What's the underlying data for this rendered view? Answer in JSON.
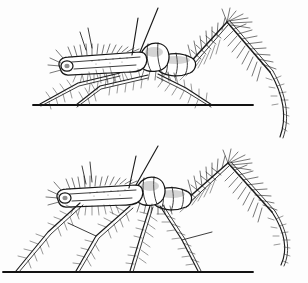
{
  "figure": {
    "background_color": "#fdfdfd",
    "ink_color": "#1b1b1b",
    "width": 308,
    "height": 283,
    "caption": "",
    "panels": [
      {
        "id": "upper",
        "name": "upper-posture",
        "label": "",
        "posture": "raised stance, body held high and horizontal, hind leg folded into tall inverted-V with curved tarsus trailing right",
        "ground_line": {
          "x1": 33,
          "y1": 105,
          "x2": 253,
          "y2": 105
        },
        "body": {
          "head_x": 63,
          "head_y": 64,
          "thorax_x": 150,
          "thorax_y": 50,
          "abdomen_x": 185,
          "abdomen_y": 62,
          "body_angle_deg": -4
        },
        "antennae": [
          {
            "from_x": 140,
            "from_y": 52,
            "to_x": 158,
            "to_y": 8
          },
          {
            "from_x": 132,
            "from_y": 55,
            "to_x": 138,
            "to_y": 18
          },
          {
            "from_x": 92,
            "from_y": 48,
            "to_x": 88,
            "to_y": 28
          }
        ],
        "legs": [
          {
            "name": "foreleg",
            "coxa_x": 120,
            "coxa_y": 72,
            "knee_x": 78,
            "knee_y": 82,
            "foot_x": 40,
            "foot_y": 104
          },
          {
            "name": "midleg",
            "coxa_x": 148,
            "coxa_y": 74,
            "knee_x": 100,
            "knee_y": 86,
            "foot_x": 75,
            "foot_y": 105
          },
          {
            "name": "hindleg-near",
            "coxa_x": 160,
            "coxa_y": 74,
            "knee_x": 185,
            "knee_y": 88,
            "foot_x": 212,
            "foot_y": 105
          },
          {
            "name": "hindleg-long",
            "coxa_x": 186,
            "coxa_y": 66,
            "knee_x": 227,
            "knee_y": 22,
            "tarsus_tip_x": 283,
            "tarsus_tip_y": 137
          }
        ]
      },
      {
        "id": "lower",
        "name": "lower-posture",
        "label": "",
        "posture": "crouched stance, body lowered, four legs splayed to ground, hind leg folded into inverted-V with long curved tarsus",
        "ground_line": {
          "x1": 3,
          "y1": 272,
          "x2": 253,
          "y2": 272
        },
        "body": {
          "head_x": 62,
          "head_y": 196,
          "thorax_x": 150,
          "thorax_y": 186,
          "abdomen_x": 180,
          "abdomen_y": 196,
          "body_angle_deg": -3
        },
        "antennae": [
          {
            "from_x": 140,
            "from_y": 188,
            "to_x": 158,
            "to_y": 146
          },
          {
            "from_x": 131,
            "from_y": 190,
            "to_x": 136,
            "to_y": 156
          },
          {
            "from_x": 92,
            "from_y": 182,
            "to_x": 90,
            "to_y": 162
          }
        ],
        "legs": [
          {
            "name": "foreleg",
            "coxa_x": 80,
            "coxa_y": 200,
            "knee_x": 48,
            "knee_y": 232,
            "foot_x": 16,
            "foot_y": 271
          },
          {
            "name": "midleg",
            "coxa_x": 130,
            "coxa_y": 204,
            "knee_x": 96,
            "knee_y": 236,
            "foot_x": 76,
            "foot_y": 271
          },
          {
            "name": "hindleg-near",
            "coxa_x": 150,
            "coxa_y": 204,
            "knee_x": 140,
            "knee_y": 238,
            "foot_x": 130,
            "foot_y": 271
          },
          {
            "name": "hindleg-far",
            "coxa_x": 160,
            "coxa_y": 204,
            "knee_x": 182,
            "knee_y": 240,
            "foot_x": 198,
            "foot_y": 271
          },
          {
            "name": "hindleg-long",
            "coxa_x": 186,
            "coxa_y": 200,
            "knee_x": 228,
            "knee_y": 163,
            "tarsus_tip_x": 284,
            "tarsus_tip_y": 265
          }
        ]
      }
    ]
  }
}
